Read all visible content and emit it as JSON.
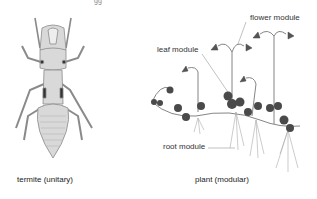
{
  "figure": {
    "left_panel": {
      "subject": "termite",
      "caption": "termite  (unitary)"
    },
    "right_panel": {
      "subject": "plant",
      "caption": "plant (modular)",
      "labels": {
        "flower": "flower module",
        "leaf": "leaf module",
        "root": "root module"
      }
    },
    "top_fragment": "gg"
  },
  "colors": {
    "body_fill": "#d9d9d9",
    "body_stroke": "#8a8a8a",
    "dark_joint": "#333333",
    "leaf_fill": "#4a4a4a",
    "stem": "#777777",
    "leader_line": "#888888",
    "text": "#333333"
  }
}
